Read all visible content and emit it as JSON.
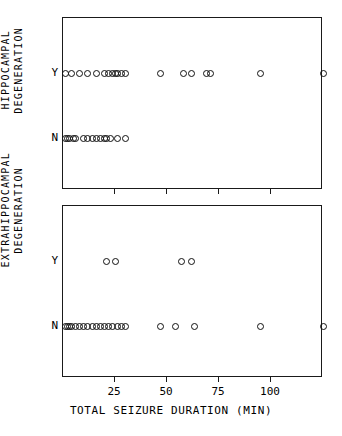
{
  "axes": {
    "x_title": "TOTAL SEIZURE DURATION (MIN)",
    "x_ticks": [
      25,
      50,
      75,
      100
    ],
    "x_min": 0,
    "x_max": 125,
    "category_labels": {
      "yes": "Y",
      "no": "N"
    }
  },
  "panels": {
    "top": {
      "y_title_line1": "HIPPOCAMPAL",
      "y_title_line2": "DEGENERATION"
    },
    "bottom": {
      "y_title_line1": "EXTRAHIPPOCAMPAL",
      "y_title_line2": "DEGENERATION"
    }
  },
  "chart_data": [
    {
      "type": "scatter",
      "title": "Hippocampal degeneration vs total seizure duration",
      "xlabel": "TOTAL SEIZURE DURATION (MIN)",
      "ylabel": "HIPPOCAMPAL DEGENERATION",
      "xlim": [
        0,
        125
      ],
      "grid": false,
      "marker": "open-circle",
      "categories": [
        "Y",
        "N"
      ],
      "series": [
        {
          "name": "Y",
          "values": [
            1,
            4,
            8,
            12,
            16,
            20,
            22,
            24,
            25,
            26,
            28,
            30,
            47,
            58,
            62,
            69,
            71,
            95,
            125
          ]
        },
        {
          "name": "N",
          "values": [
            1,
            2,
            3,
            5,
            6,
            10,
            12,
            14,
            16,
            18,
            20,
            21,
            23,
            26,
            30
          ]
        }
      ]
    },
    {
      "type": "scatter",
      "title": "Extrahippocampal degeneration vs total seizure duration",
      "xlabel": "TOTAL SEIZURE DURATION (MIN)",
      "ylabel": "EXTRAHIPPOCAMPAL DEGENERATION",
      "xlim": [
        0,
        125
      ],
      "grid": false,
      "marker": "open-circle",
      "categories": [
        "Y",
        "N"
      ],
      "series": [
        {
          "name": "Y",
          "values": [
            21,
            25,
            57,
            62
          ]
        },
        {
          "name": "N",
          "values": [
            1,
            2,
            3,
            4,
            6,
            8,
            10,
            12,
            14,
            16,
            18,
            20,
            22,
            24,
            26,
            28,
            30,
            47,
            54,
            63,
            95,
            125
          ]
        }
      ]
    }
  ]
}
